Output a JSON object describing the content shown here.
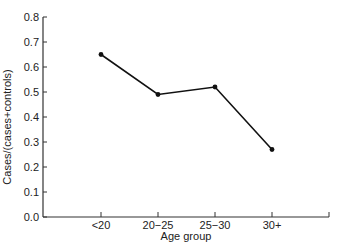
{
  "chart_data": {
    "type": "line",
    "title": "",
    "xlabel": "Age group",
    "ylabel": "Cases/(cases+controls)",
    "categories": [
      "<20",
      "20−25",
      "25−30",
      "30+"
    ],
    "series": [
      {
        "name": "Cases/(cases+controls)",
        "values": [
          0.65,
          0.49,
          0.52,
          0.27
        ]
      }
    ],
    "ylim": [
      0.0,
      0.8
    ],
    "yticks": [
      "0.0",
      "0.1",
      "0.2",
      "0.3",
      "0.4",
      "0.5",
      "0.6",
      "0.7",
      "0.8"
    ],
    "grid": false,
    "legend": null,
    "colors": {
      "line": "#111111",
      "axis": "#333333"
    }
  }
}
